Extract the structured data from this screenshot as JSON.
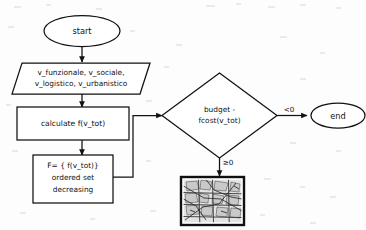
{
  "diagram": {
    "background_color": "#fdfdfd",
    "stroke_color": "#111111",
    "nodes": {
      "start": {
        "label": "start",
        "shape": "ellipse"
      },
      "input": {
        "shape": "parallelogram",
        "line1": "v_funzionale, v_sociale,",
        "line2": "v_logistico, v_urbanistico"
      },
      "calculate": {
        "shape": "rectangle",
        "label": "calculate f(v_tot)"
      },
      "ordered_set": {
        "shape": "rectangle",
        "line1": "F= { f(v_tot)}",
        "line2": "ordered set",
        "line3": "decreasing"
      },
      "decision": {
        "shape": "diamond",
        "line1": "budget -",
        "line2": "fcost(v_tot)"
      },
      "end": {
        "label": "end",
        "shape": "ellipse"
      },
      "map": {
        "shape": "image",
        "alt": "city street map thumbnail"
      }
    },
    "edges": [
      {
        "from": "start",
        "to": "input",
        "label": ""
      },
      {
        "from": "input",
        "to": "calculate",
        "label": ""
      },
      {
        "from": "calculate",
        "to": "ordered_set",
        "label": ""
      },
      {
        "from": "ordered_set",
        "to": "decision",
        "label": ""
      },
      {
        "from": "decision",
        "to": "end",
        "label": "<0"
      },
      {
        "from": "decision",
        "to": "map",
        "label": "≥0"
      }
    ],
    "edge_labels": {
      "negative": "<0",
      "non_negative": "≥0"
    }
  }
}
